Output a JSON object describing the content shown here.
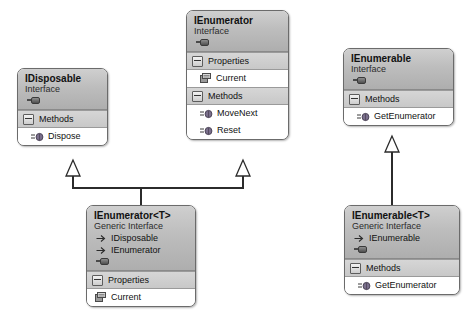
{
  "diagram": {
    "type": "uml-class-diagram",
    "background_color": "#ffffff",
    "header_color": "#bdbdbd",
    "section_color": "#cdcdcd",
    "border_color": "#6b6b6b",
    "connector_color": "#2b2b2b"
  },
  "labels": {
    "interface_stereotype": "Interface",
    "generic_interface_stereotype": "Generic Interface",
    "properties_section": "Properties",
    "methods_section": "Methods"
  },
  "boxes": {
    "idisposable": {
      "title": "IDisposable",
      "stereotype": "Interface",
      "sections": [
        {
          "name": "Methods",
          "members": [
            "Dispose"
          ]
        }
      ]
    },
    "ienumerator": {
      "title": "IEnumerator",
      "stereotype": "Interface",
      "properties_label": "Properties",
      "properties": [
        "Current"
      ],
      "methods_label": "Methods",
      "methods": [
        "MoveNext",
        "Reset"
      ]
    },
    "ienumerable": {
      "title": "IEnumerable",
      "stereotype": "Interface",
      "methods_label": "Methods",
      "methods": [
        "GetEnumerator"
      ]
    },
    "ienumerator_t": {
      "title": "IEnumerator<T>",
      "stereotype": "Generic Interface",
      "base_types": [
        "IDisposable",
        "IEnumerator"
      ],
      "properties_label": "Properties",
      "properties": [
        "Current"
      ]
    },
    "ienumerable_t": {
      "title": "IEnumerable<T>",
      "stereotype": "Generic Interface",
      "base_types": [
        "IEnumerable"
      ],
      "methods_label": "Methods",
      "methods": [
        "GetEnumerator"
      ]
    }
  },
  "relationships": [
    {
      "from": "IEnumerator<T>",
      "to": "IDisposable",
      "kind": "inheritance"
    },
    {
      "from": "IEnumerator<T>",
      "to": "IEnumerator",
      "kind": "inheritance"
    },
    {
      "from": "IEnumerable<T>",
      "to": "IEnumerable",
      "kind": "inheritance"
    }
  ],
  "icons": {
    "collapse": "collapse-icon",
    "interface_handle": "interface-handle-icon",
    "base_arrow": "base-type-arrow-icon",
    "method": "method-icon",
    "property": "property-icon"
  }
}
